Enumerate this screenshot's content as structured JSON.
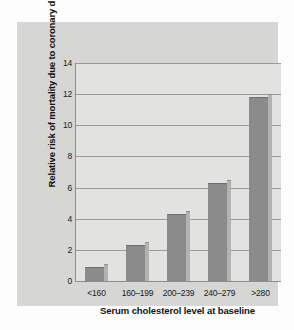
{
  "chart_data": {
    "type": "bar",
    "title": "",
    "xlabel": "Serum cholesterol level at baseline",
    "ylabel": "Relative risk of mortality due to coronary disease",
    "categories": [
      "<160",
      "160–199",
      "200–239",
      "240–279",
      ">280"
    ],
    "values": [
      0.9,
      2.3,
      4.3,
      6.3,
      11.8
    ],
    "ylim": [
      0,
      14
    ],
    "yticks": [
      0,
      2,
      4,
      6,
      8,
      10,
      12,
      14
    ],
    "ytick_labels": [
      "0",
      "2",
      "4",
      "6",
      "8",
      "10",
      "12",
      "14"
    ],
    "grid": true,
    "legend": false,
    "legend_position": "none",
    "bar_color": "#8b8b8b",
    "bar_side_color": "#b2b2b0",
    "plot_background": "#e2e2e0",
    "panel_background": "#d6d6d4",
    "gridline_color": "#9a9a9a",
    "axis_color": "#8d8d8d",
    "text_color": "#121212"
  }
}
